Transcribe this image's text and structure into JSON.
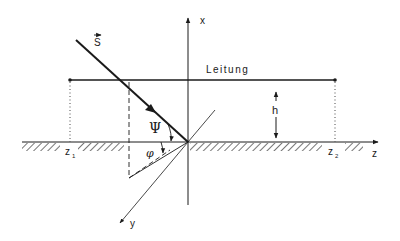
{
  "diagram": {
    "labels": {
      "x_axis": "x",
      "y_axis": "y",
      "z_axis": "z",
      "vector": "S",
      "line": "Leitung",
      "height": "h",
      "z1": "z",
      "z1_sub": "1",
      "z2": "z",
      "z2_sub": "2",
      "psi": "Ψ",
      "phi": "φ"
    },
    "colors": {
      "stroke": "#1a1a1a",
      "background": "#ffffff"
    }
  }
}
